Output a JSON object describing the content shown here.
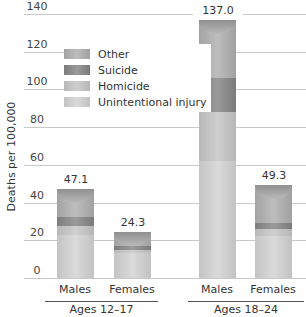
{
  "chart_data": {
    "type": "bar",
    "stacked": true,
    "title": "",
    "xlabel": "",
    "ylabel": "Deaths per 100,000",
    "ylim": [
      0,
      140
    ],
    "yticks": [
      0,
      20,
      40,
      60,
      80,
      100,
      120,
      140
    ],
    "grid": true,
    "legend_position": "upper-left",
    "groups": [
      {
        "label": "Ages 12–17",
        "categories": [
          "Males",
          "Females"
        ]
      },
      {
        "label": "Ages 18–24",
        "categories": [
          "Males",
          "Females"
        ]
      }
    ],
    "categories": [
      "Males (12–17)",
      "Females (12–17)",
      "Males (18–24)",
      "Females (18–24)"
    ],
    "totals": [
      47.1,
      24.3,
      137.0,
      49.3
    ],
    "total_labels": [
      "47.1",
      "24.3",
      "137.0",
      "49.3"
    ],
    "series": [
      {
        "name": "Unintentional injury",
        "values": [
          23,
          13.5,
          62,
          22.5
        ]
      },
      {
        "name": "Homicide",
        "values": [
          4.5,
          1.5,
          26,
          3.5
        ]
      },
      {
        "name": "Suicide",
        "values": [
          5,
          2,
          18,
          3
        ]
      },
      {
        "name": "Other",
        "values": [
          14.6,
          7.3,
          31,
          20.3
        ]
      }
    ]
  },
  "legend": [
    {
      "key": "other",
      "label": "Other"
    },
    {
      "key": "suic",
      "label": "Suicide"
    },
    {
      "key": "homi",
      "label": "Homicide"
    },
    {
      "key": "unint",
      "label": "Unintentional injury"
    }
  ]
}
